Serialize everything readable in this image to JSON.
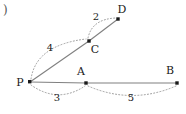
{
  "figure": {
    "corner_mark": ")",
    "background_color": "#ffffff",
    "edge_color": "#808080",
    "arc_color": "#999999",
    "node_color": "#1a1a1a",
    "label_color": "#1a1a1a",
    "width": 186,
    "height": 114
  },
  "nodes": [
    {
      "id": "P",
      "label": "P",
      "x": 30,
      "y": 82,
      "label_x": 20,
      "label_y": 82
    },
    {
      "id": "A",
      "label": "A",
      "x": 86,
      "y": 83,
      "label_x": 81,
      "label_y": 71
    },
    {
      "id": "B",
      "label": "B",
      "x": 177,
      "y": 83,
      "label_x": 170,
      "label_y": 70
    },
    {
      "id": "C",
      "label": "C",
      "x": 89,
      "y": 41,
      "label_x": 95,
      "label_y": 49
    },
    {
      "id": "D",
      "label": "D",
      "x": 118,
      "y": 19,
      "label_x": 122,
      "label_y": 9
    }
  ],
  "edges": [
    {
      "from": "P",
      "to": "A",
      "style": "solid"
    },
    {
      "from": "A",
      "to": "B",
      "style": "solid"
    },
    {
      "from": "P",
      "to": "C",
      "style": "solid"
    },
    {
      "from": "C",
      "to": "D",
      "style": "solid"
    }
  ],
  "arcs": [
    {
      "id": "arc-P-A",
      "from": "P",
      "to": "A",
      "weight": "3",
      "style": "dotted",
      "bow": "below",
      "label_x": 57,
      "label_y": 98,
      "path": "M 31 85 Q 58 104 85 86"
    },
    {
      "id": "arc-A-B",
      "from": "A",
      "to": "B",
      "weight": "5",
      "style": "dotted",
      "bow": "below",
      "label_x": 131,
      "label_y": 98,
      "path": "M 88 86 Q 132 105 176 86"
    },
    {
      "id": "arc-P-C",
      "from": "P",
      "to": "C",
      "weight": "4",
      "style": "dotted",
      "bow": "above-left",
      "label_x": 50,
      "label_y": 48,
      "path": "M 31 79 Q 36 45 86 39"
    },
    {
      "id": "arc-C-D",
      "from": "C",
      "to": "D",
      "weight": "2",
      "style": "dotted",
      "bow": "above-left",
      "label_x": 96,
      "label_y": 17,
      "path": "M 88 38 Q 92 19 116 18"
    }
  ]
}
